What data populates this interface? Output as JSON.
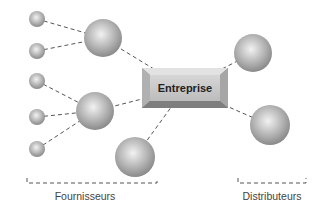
{
  "diagram": {
    "center": {
      "label": "Entreprise",
      "x": 142,
      "y": 68,
      "w": 86,
      "h": 40
    },
    "groups": [
      {
        "label": "Fournisseurs",
        "bracket": {
          "x1": 27,
          "x2": 157,
          "y": 183
        },
        "label_x": 85,
        "label_y": 190
      },
      {
        "label": "Distributeurs",
        "bracket": {
          "x1": 238,
          "x2": 306,
          "y": 183
        },
        "label_x": 272,
        "label_y": 190
      }
    ],
    "nodes": [
      {
        "id": "s1",
        "x": 37,
        "y": 19,
        "r": 8
      },
      {
        "id": "s2",
        "x": 37,
        "y": 51,
        "r": 8
      },
      {
        "id": "s3",
        "x": 37,
        "y": 81,
        "r": 8
      },
      {
        "id": "s4",
        "x": 37,
        "y": 117,
        "r": 8
      },
      {
        "id": "s5",
        "x": 37,
        "y": 149,
        "r": 8
      },
      {
        "id": "b1",
        "x": 103,
        "y": 38,
        "r": 19
      },
      {
        "id": "b2",
        "x": 95,
        "y": 111,
        "r": 19
      },
      {
        "id": "b3",
        "x": 135,
        "y": 157,
        "r": 20
      },
      {
        "id": "d1",
        "x": 253,
        "y": 53,
        "r": 19
      },
      {
        "id": "d2",
        "x": 270,
        "y": 125,
        "r": 20
      }
    ],
    "edges": [
      [
        "s1",
        "b1"
      ],
      [
        "s2",
        "b1"
      ],
      [
        "s3",
        "b2"
      ],
      [
        "s4",
        "b2"
      ],
      [
        "s5",
        "b2"
      ],
      [
        "b1",
        "center"
      ],
      [
        "b2",
        "center"
      ],
      [
        "b3",
        "center"
      ],
      [
        "center",
        "d1"
      ],
      [
        "center",
        "d2"
      ]
    ],
    "colors": {
      "sphere_light": "#f0f0f0",
      "sphere_dark": "#8a8a8a",
      "line": "#555555",
      "box_face": "#c8c8c8",
      "box_edge": "#8c8c8c"
    }
  }
}
